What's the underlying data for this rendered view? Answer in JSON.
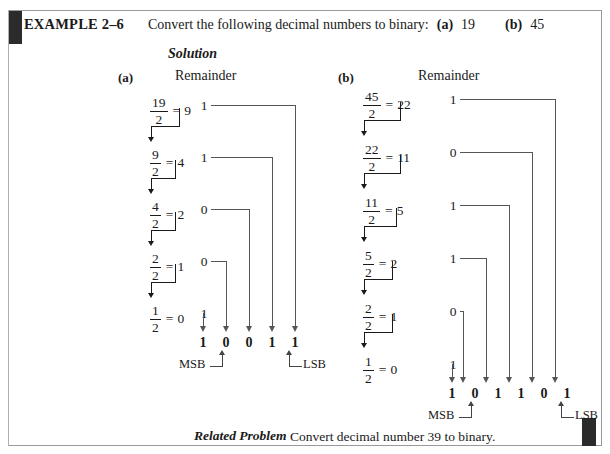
{
  "example": {
    "label": "EXAMPLE 2–6",
    "statement_lead": "Convert the following decimal numbers to binary:",
    "part_a_tag": "(a)",
    "part_a_value": "19",
    "part_b_tag": "(b)",
    "part_b_value": "45",
    "solution_heading": "Solution"
  },
  "columns": [
    {
      "tag": "(a)",
      "remainder_heading": "Remainder",
      "decimal": "19",
      "divisions": [
        {
          "numerator": "19",
          "denominator": "2",
          "equals": "=",
          "quotient": "9",
          "remainder": "1"
        },
        {
          "numerator": "9",
          "denominator": "2",
          "equals": "=",
          "quotient": "4",
          "remainder": "1"
        },
        {
          "numerator": "4",
          "denominator": "2",
          "equals": "=",
          "quotient": "2",
          "remainder": "0"
        },
        {
          "numerator": "2",
          "denominator": "2",
          "equals": "=",
          "quotient": "1",
          "remainder": "0"
        },
        {
          "numerator": "1",
          "denominator": "2",
          "equals": "=",
          "quotient": "0",
          "remainder": "1"
        }
      ],
      "result_bits": [
        "1",
        "0",
        "0",
        "1",
        "1"
      ],
      "msb_label": "MSB",
      "lsb_label": "LSB"
    },
    {
      "tag": "(b)",
      "remainder_heading": "Remainder",
      "decimal": "45",
      "divisions": [
        {
          "numerator": "45",
          "denominator": "2",
          "equals": "=",
          "quotient": "22",
          "remainder": "1"
        },
        {
          "numerator": "22",
          "denominator": "2",
          "equals": "=",
          "quotient": "11",
          "remainder": "0"
        },
        {
          "numerator": "11",
          "denominator": "2",
          "equals": "=",
          "quotient": "5",
          "remainder": "1"
        },
        {
          "numerator": "5",
          "denominator": "2",
          "equals": "=",
          "quotient": "2",
          "remainder": "1"
        },
        {
          "numerator": "2",
          "denominator": "2",
          "equals": "=",
          "quotient": "1",
          "remainder": "0"
        },
        {
          "numerator": "1",
          "denominator": "2",
          "equals": "=",
          "quotient": "0",
          "remainder": "1"
        }
      ],
      "result_bits": [
        "1",
        "0",
        "1",
        "1",
        "0",
        "1"
      ],
      "msb_label": "MSB",
      "lsb_label": "LSB"
    }
  ],
  "related_problem": {
    "label": "Related Problem",
    "text": "Convert decimal number 39 to binary."
  },
  "colors": {
    "ink": "#1a1a1a",
    "rule": "#9a9a9a",
    "tab": "#2b2b2b",
    "line": "#555555"
  }
}
